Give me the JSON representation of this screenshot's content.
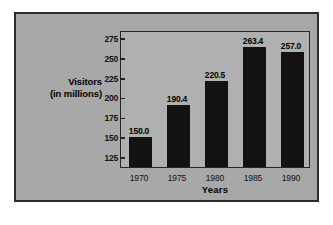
{
  "chart_data": {
    "type": "bar",
    "title": "",
    "xlabel": "Years",
    "ylabel": "Visitors (in millions)",
    "ylabel_line1": "Visitors",
    "ylabel_line2": "(in millions)",
    "categories": [
      "1970",
      "1975",
      "1980",
      "1985",
      "1990"
    ],
    "values": [
      150.0,
      190.4,
      220.5,
      263.4,
      257.0
    ],
    "value_labels": [
      "150.0",
      "190.4",
      "220.5",
      "263.4",
      "257.0"
    ],
    "yticks": [
      275,
      250,
      225,
      200,
      175,
      150,
      125
    ],
    "ytick_labels": [
      "275",
      "250",
      "225",
      "200",
      "175",
      "150",
      "125"
    ],
    "ylim": [
      112,
      285
    ],
    "grid": false,
    "legend": false,
    "bar_color": "#121212",
    "plot_background": "#b0b0b0",
    "panel_background": "#a8a8a8",
    "frame_color": "#2b2b2b"
  }
}
